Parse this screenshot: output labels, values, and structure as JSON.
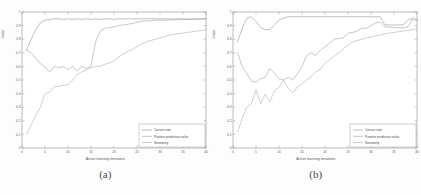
{
  "figure": {
    "panels": [
      {
        "caption": "(a)",
        "chart_data": {
          "type": "line",
          "title": "",
          "xlabel": "Active learning iterations",
          "ylabel": "Value",
          "xlim": [
            0,
            40
          ],
          "ylim": [
            0,
            1
          ],
          "xticks": [
            0,
            5,
            10,
            15,
            20,
            25,
            30,
            35,
            40
          ],
          "yticks": [
            0,
            0.1,
            0.2,
            0.3,
            0.4,
            0.5,
            0.6,
            0.7,
            0.8,
            0.9,
            1
          ],
          "grid": false,
          "legend_position": "lower right",
          "x": [
            1,
            2,
            3,
            4,
            5,
            6,
            7,
            8,
            9,
            10,
            11,
            12,
            13,
            14,
            15,
            16,
            17,
            18,
            19,
            20,
            21,
            22,
            23,
            24,
            25,
            26,
            27,
            28,
            29,
            30,
            31,
            32,
            33,
            34,
            35,
            36,
            37,
            38,
            39,
            40
          ],
          "series": [
            {
              "name": "Correct rate",
              "color": "#8c8c8c",
              "values": [
                0.72,
                0.8,
                0.87,
                0.92,
                0.94,
                0.945,
                0.95,
                0.95,
                0.945,
                0.95,
                0.945,
                0.95,
                0.945,
                0.95,
                0.945,
                0.95,
                0.945,
                0.95,
                0.95,
                0.945,
                0.95,
                0.95,
                0.95,
                0.95,
                0.95,
                0.948,
                0.95,
                0.95,
                0.95,
                0.948,
                0.95,
                0.95,
                0.948,
                0.95,
                0.95,
                0.948,
                0.95,
                0.948,
                0.95,
                0.95
              ]
            },
            {
              "name": "Positive predictive value",
              "color": "#9a9a9a",
              "values": [
                0.72,
                0.7,
                0.66,
                0.62,
                0.595,
                0.56,
                0.6,
                0.59,
                0.6,
                0.575,
                0.6,
                0.565,
                0.6,
                0.585,
                0.6,
                0.78,
                0.86,
                0.88,
                0.885,
                0.89,
                0.9,
                0.905,
                0.91,
                0.915,
                0.925,
                0.93,
                0.935,
                0.935,
                0.94,
                0.94,
                0.94,
                0.942,
                0.942,
                0.944,
                0.944,
                0.945,
                0.946,
                0.947,
                0.948,
                0.95
              ]
            },
            {
              "name": "Sensitivity",
              "color": "#a8a8a8",
              "values": [
                0.1,
                0.17,
                0.24,
                0.3,
                0.4,
                0.41,
                0.45,
                0.455,
                0.46,
                0.465,
                0.5,
                0.54,
                0.56,
                0.575,
                0.59,
                0.6,
                0.6,
                0.615,
                0.625,
                0.64,
                0.67,
                0.69,
                0.71,
                0.725,
                0.745,
                0.765,
                0.78,
                0.79,
                0.8,
                0.81,
                0.82,
                0.83,
                0.835,
                0.84,
                0.845,
                0.85,
                0.855,
                0.86,
                0.865,
                0.87
              ]
            }
          ]
        }
      },
      {
        "caption": "(b)",
        "chart_data": {
          "type": "line",
          "title": "",
          "xlabel": "Active learning iterations",
          "ylabel": "Value",
          "xlim": [
            0,
            40
          ],
          "ylim": [
            0,
            1
          ],
          "xticks": [
            0,
            5,
            10,
            15,
            20,
            25,
            30,
            35,
            40
          ],
          "yticks": [
            0,
            0.1,
            0.2,
            0.3,
            0.4,
            0.5,
            0.6,
            0.7,
            0.8,
            0.9,
            1
          ],
          "grid": false,
          "legend_position": "lower right",
          "x": [
            1,
            2,
            3,
            4,
            5,
            6,
            7,
            8,
            9,
            10,
            11,
            12,
            13,
            14,
            15,
            16,
            17,
            18,
            19,
            20,
            21,
            22,
            23,
            24,
            25,
            26,
            27,
            28,
            29,
            30,
            31,
            32,
            33,
            34,
            35,
            36,
            37,
            38,
            39,
            40
          ],
          "series": [
            {
              "name": "Correct rate",
              "color": "#8c8c8c",
              "values": [
                0.78,
                0.88,
                0.955,
                0.965,
                0.93,
                0.885,
                0.87,
                0.87,
                0.905,
                0.94,
                0.955,
                0.965,
                0.965,
                0.965,
                0.965,
                0.965,
                0.965,
                0.965,
                0.965,
                0.965,
                0.965,
                0.965,
                0.965,
                0.965,
                0.965,
                0.965,
                0.965,
                0.965,
                0.965,
                0.965,
                0.965,
                0.965,
                0.905,
                0.905,
                0.905,
                0.905,
                0.905,
                0.94,
                0.955,
                0.945
              ]
            },
            {
              "name": "Positive predictive value",
              "color": "#9a9a9a",
              "values": [
                0.7,
                0.6,
                0.55,
                0.49,
                0.485,
                0.51,
                0.52,
                0.585,
                0.55,
                0.51,
                0.5,
                0.52,
                0.5,
                0.545,
                0.6,
                0.68,
                0.7,
                0.68,
                0.72,
                0.745,
                0.77,
                0.8,
                0.805,
                0.81,
                0.845,
                0.85,
                0.86,
                0.88,
                0.88,
                0.9,
                0.92,
                0.925,
                0.89,
                0.89,
                0.885,
                0.885,
                0.885,
                0.89,
                0.945,
                0.935
              ]
            },
            {
              "name": "Sensitivity",
              "color": "#a8a8a8",
              "values": [
                0.12,
                0.22,
                0.3,
                0.325,
                0.43,
                0.325,
                0.395,
                0.34,
                0.42,
                0.445,
                0.5,
                0.44,
                0.405,
                0.45,
                0.47,
                0.5,
                0.525,
                0.56,
                0.58,
                0.625,
                0.65,
                0.675,
                0.7,
                0.73,
                0.755,
                0.78,
                0.79,
                0.8,
                0.81,
                0.815,
                0.825,
                0.83,
                0.84,
                0.845,
                0.85,
                0.855,
                0.86,
                0.865,
                0.87,
                0.875
              ]
            }
          ]
        }
      }
    ]
  }
}
